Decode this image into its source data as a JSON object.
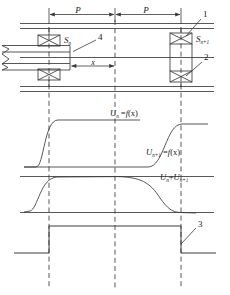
{
  "diagram": {
    "stroke_color": "#3a3a3a",
    "text_color": "#1a1a1a",
    "callouts": [
      {
        "id": "1",
        "label": "1",
        "target": "coil-sn1-upper"
      },
      {
        "id": "2",
        "label": "2",
        "target": "coil-sn1-lower"
      },
      {
        "id": "3",
        "label": "3",
        "target": "square-wave-falling-edge"
      },
      {
        "id": "4",
        "label": "4",
        "target": "moving-core"
      }
    ],
    "dimensions": [
      {
        "name": "pitch-left",
        "label": "P"
      },
      {
        "name": "pitch-right",
        "label": "P"
      },
      {
        "name": "displacement",
        "label": "x"
      }
    ],
    "coils": [
      {
        "name": "coil-sn",
        "label": "S",
        "subscript": "n"
      },
      {
        "name": "coil-sn1",
        "label": "S",
        "subscript": "n+1"
      }
    ],
    "waveforms": [
      {
        "name": "wave-un",
        "label_main": "U",
        "label_sub": "n",
        "label_eq": " =",
        "label_fn": "f",
        "label_arg": "(x)"
      },
      {
        "name": "wave-un1",
        "label_main": "U",
        "label_sub": "n+1",
        "label_eq": " =",
        "label_fn": "f",
        "label_arg": "(x)"
      },
      {
        "name": "wave-sum",
        "label_main": "U",
        "label_sub": "n",
        "label_op": "+",
        "label_main2": "U",
        "label_sub2": "n+1"
      }
    ],
    "square_wave": {
      "name": "output-square-wave",
      "low_level": "low",
      "high_level": "high"
    }
  }
}
